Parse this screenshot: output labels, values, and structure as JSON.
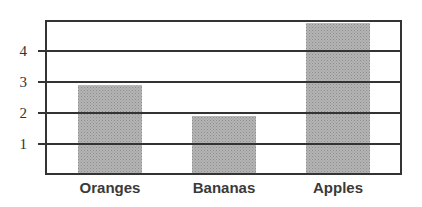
{
  "chart_data": {
    "type": "bar",
    "title": "",
    "xlabel": "",
    "ylabel": "",
    "categories": [
      "Oranges",
      "Bananas",
      "Apples"
    ],
    "values": [
      2.9,
      1.9,
      4.9
    ],
    "ylim": [
      0,
      5
    ],
    "yticks": [
      1,
      2,
      3,
      4
    ],
    "grid": true,
    "legend": null,
    "bar_color": "#a9a9a9",
    "frame_color": "#333333"
  }
}
